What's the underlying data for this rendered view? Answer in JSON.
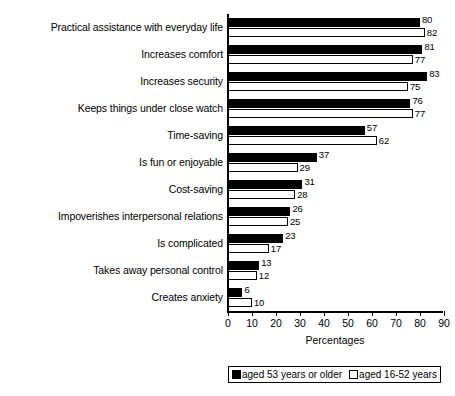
{
  "chart_data": {
    "type": "bar",
    "orientation": "horizontal",
    "title": "",
    "xlabel": "Percentages",
    "ylabel": "",
    "xlim": [
      0,
      90
    ],
    "xticks": [
      0,
      10,
      20,
      30,
      40,
      50,
      60,
      70,
      80,
      90
    ],
    "grid": false,
    "legend_position": "bottom",
    "categories": [
      "Practical assistance with everyday life",
      "Increases comfort",
      "Increases security",
      "Keeps things under close watch",
      "Time-saving",
      "Is fun or enjoyable",
      "Cost-saving",
      "Impoverishes interpersonal relations",
      "Is complicated",
      "Takes away personal control",
      "Creates anxiety"
    ],
    "series": [
      {
        "name": "aged 53 years or older",
        "color": "#000000",
        "fill": "solid",
        "values": [
          80,
          81,
          83,
          76,
          57,
          37,
          31,
          26,
          23,
          13,
          6
        ]
      },
      {
        "name": "aged 16-52 years",
        "color": "#ffffff",
        "fill": "hollow",
        "values": [
          82,
          77,
          75,
          77,
          62,
          29,
          28,
          25,
          17,
          12,
          10
        ]
      }
    ]
  },
  "legend": {
    "items": [
      {
        "label": "aged 53 years or older",
        "swatch": "filled"
      },
      {
        "label": "aged 16-52 years",
        "swatch": "hollow"
      }
    ]
  },
  "axis": {
    "x_title": "Percentages"
  }
}
